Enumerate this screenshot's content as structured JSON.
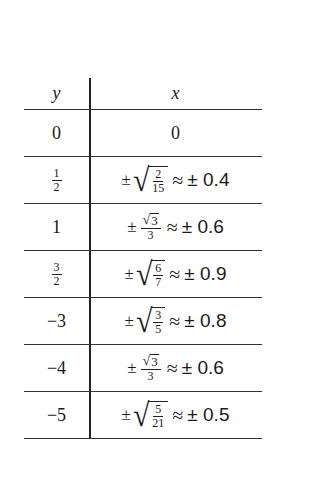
{
  "table": {
    "headers": {
      "y": "y",
      "x": "x"
    },
    "rows": [
      {
        "y": "0",
        "y_frac": null,
        "x_type": "plain",
        "x_value": "0"
      },
      {
        "y": "1/2",
        "y_frac": {
          "num": "1",
          "den": "2"
        },
        "x_type": "sqrt_frac",
        "pm": "±",
        "num": "2",
        "den": "15",
        "approx": "≈",
        "approx_value": "± 0.4"
      },
      {
        "y": "1",
        "y_frac": null,
        "x_type": "frac_sqrt_num",
        "pm": "±",
        "num": "3",
        "den": "3",
        "approx": "≈",
        "approx_value": "± 0.6"
      },
      {
        "y": "3/2",
        "y_frac": {
          "num": "3",
          "den": "2"
        },
        "x_type": "sqrt_frac",
        "pm": "±",
        "num": "6",
        "den": "7",
        "approx": "≈",
        "approx_value": "± 0.9"
      },
      {
        "y": "−3",
        "y_frac": null,
        "x_type": "sqrt_frac",
        "pm": "±",
        "num": "3",
        "den": "5",
        "approx": "≈",
        "approx_value": "± 0.8"
      },
      {
        "y": "−4",
        "y_frac": null,
        "x_type": "frac_sqrt_num",
        "pm": "±",
        "num": "3",
        "den": "3",
        "approx": "≈",
        "approx_value": "± 0.6"
      },
      {
        "y": "−5",
        "y_frac": null,
        "x_type": "sqrt_frac",
        "pm": "±",
        "num": "5",
        "den": "21",
        "approx": "≈",
        "approx_value": "± 0.5"
      }
    ]
  }
}
